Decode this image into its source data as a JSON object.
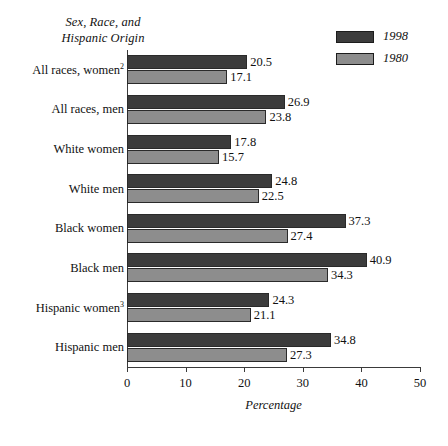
{
  "chart_data": {
    "type": "bar",
    "orientation": "horizontal",
    "title": "Sex, Race, and Hispanic Origin",
    "title_lines": [
      "Sex, Race, and",
      "Hispanic Origin"
    ],
    "xlabel": "Percentage",
    "ylabel": "",
    "xlim": [
      0,
      50
    ],
    "xticks": [
      0,
      10,
      20,
      30,
      40,
      50
    ],
    "xtick_labels": [
      "0",
      "10",
      "20",
      "30",
      "40",
      "50"
    ],
    "grid": false,
    "legend_position": "top-right",
    "categories": [
      "All races, women",
      "All races, men",
      "White women",
      "White men",
      "Black women",
      "Black men",
      "Hispanic women",
      "Hispanic men"
    ],
    "category_footnotes": [
      "2",
      "",
      "",
      "",
      "",
      "",
      "3",
      ""
    ],
    "series": [
      {
        "name": "1998",
        "color": "#3c3c3c",
        "values": [
          20.5,
          26.9,
          17.8,
          24.8,
          37.3,
          40.9,
          24.3,
          34.8
        ],
        "value_labels": [
          "20.5",
          "26.9",
          "17.8",
          "24.8",
          "37.3",
          "40.9",
          "24.3",
          "34.8"
        ]
      },
      {
        "name": "1980",
        "color": "#8d8d8d",
        "values": [
          17.1,
          23.8,
          15.7,
          22.5,
          27.4,
          34.3,
          21.1,
          27.3
        ],
        "value_labels": [
          "17.1",
          "23.8",
          "15.7",
          "22.5",
          "27.4",
          "34.3",
          "21.1",
          "27.3"
        ]
      }
    ]
  }
}
